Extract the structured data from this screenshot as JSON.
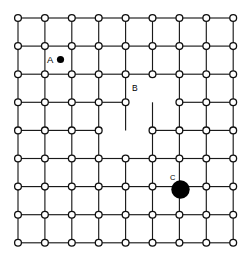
{
  "figure": {
    "background_color": "#ffffff",
    "line_color": "#1a1a1a",
    "node_fill": "#ffffff",
    "node_stroke": "#101010",
    "atom_fill": "#000000"
  },
  "lattice": {
    "type": "square-grid",
    "columns": 9,
    "rows": 9,
    "origin_x": 18,
    "origin_y": 18,
    "spacing_x": 26.9,
    "spacing_y": 28.1,
    "node_radius": 3.4,
    "missing_nodes": [
      {
        "col": 5,
        "row": 3
      },
      {
        "col": 4,
        "row": 4
      }
    ],
    "missing_bonds": [
      {
        "from_col": 4,
        "from_row": 3,
        "to_col": 5,
        "to_row": 3
      },
      {
        "from_col": 5,
        "from_row": 3,
        "to_col": 6,
        "to_row": 3
      },
      {
        "from_col": 5,
        "from_row": 2,
        "to_col": 5,
        "to_row": 3
      },
      {
        "from_col": 3,
        "from_row": 4,
        "to_col": 4,
        "to_row": 4
      },
      {
        "from_col": 4,
        "from_row": 4,
        "to_col": 5,
        "to_row": 4
      },
      {
        "from_col": 4,
        "from_row": 4,
        "to_col": 4,
        "to_row": 5
      }
    ]
  },
  "defects": [
    {
      "id": "A",
      "label": "A",
      "kind": "interstitial-atom",
      "label_x": 47,
      "label_y": 63,
      "marker_x": 60.5,
      "marker_y": 59.5,
      "marker_radius": 3.6
    },
    {
      "id": "B",
      "label": "B",
      "kind": "vacancy",
      "label_x": 132,
      "label_y": 91,
      "marker_x": 152,
      "marker_y": 102,
      "marker_radius": 0
    },
    {
      "id": "C",
      "label": "C",
      "kind": "substitutional-atom",
      "label_x": 170,
      "label_y": 180,
      "marker_x": 180.5,
      "marker_y": 189.5,
      "marker_radius": 9.2
    }
  ]
}
